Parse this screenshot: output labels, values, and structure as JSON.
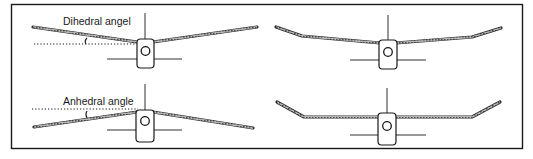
{
  "figure": {
    "panels": [
      {
        "id": "dihedral-straight",
        "label": "Dihedral angel",
        "wing_type": "dihedral",
        "has_angle_marker": true
      },
      {
        "id": "dihedral-polyhedral",
        "label": "",
        "wing_type": "polyhedral",
        "has_angle_marker": false
      },
      {
        "id": "anhedral-straight",
        "label": "Anhedral angle",
        "wing_type": "anhedral",
        "has_angle_marker": true
      },
      {
        "id": "gull-tip-up",
        "label": "",
        "wing_type": "flat-center-tip-dihedral",
        "has_angle_marker": false
      }
    ],
    "colors": {
      "line": "#1a1a1a",
      "wing_fill": "#9a9a9a",
      "background": "#ffffff"
    }
  }
}
